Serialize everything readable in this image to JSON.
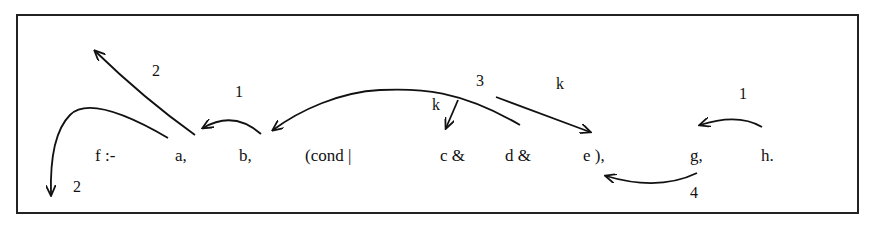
{
  "diagram": {
    "terms": [
      {
        "id": "f",
        "text": "f :-",
        "x": 95,
        "y": 146
      },
      {
        "id": "a",
        "text": "a,",
        "x": 175,
        "y": 146
      },
      {
        "id": "b",
        "text": "b,",
        "x": 239,
        "y": 146
      },
      {
        "id": "cond",
        "text": "(cond |",
        "x": 305,
        "y": 146
      },
      {
        "id": "c",
        "text": "c &",
        "x": 440,
        "y": 146
      },
      {
        "id": "d",
        "text": "d &",
        "x": 505,
        "y": 146
      },
      {
        "id": "e",
        "text": "e ),",
        "x": 583,
        "y": 146
      },
      {
        "id": "g",
        "text": "g,",
        "x": 690,
        "y": 146
      },
      {
        "id": "h",
        "text": "h.",
        "x": 761,
        "y": 146
      }
    ],
    "labels": [
      {
        "id": "l2-top",
        "text": "2",
        "x": 152,
        "y": 70
      },
      {
        "id": "l1-ab",
        "text": "1",
        "x": 235,
        "y": 91
      },
      {
        "id": "l2-bottom",
        "text": "2",
        "x": 73,
        "y": 186
      },
      {
        "id": "l3",
        "text": "3",
        "x": 476,
        "y": 80
      },
      {
        "id": "lk-c",
        "text": "k",
        "x": 432,
        "y": 104
      },
      {
        "id": "lk-e",
        "text": "k",
        "x": 556,
        "y": 83
      },
      {
        "id": "l1-hg",
        "text": "1",
        "x": 739,
        "y": 93
      },
      {
        "id": "l4",
        "text": "4",
        "x": 690,
        "y": 192
      }
    ],
    "arrows": [
      {
        "id": "a-to-top",
        "from": "a",
        "label": "2"
      },
      {
        "id": "a-to-bottom",
        "from": "a",
        "label": "2"
      },
      {
        "id": "b-to-a",
        "from": "b",
        "to": "a",
        "label": "1"
      },
      {
        "id": "d-to-b",
        "from": "d",
        "to": "b",
        "label": "3"
      },
      {
        "id": "to-c",
        "to": "c",
        "label": "k"
      },
      {
        "id": "to-e",
        "to": "e",
        "label": "k"
      },
      {
        "id": "h-to-g",
        "from": "h",
        "to": "g",
        "label": "1"
      },
      {
        "id": "g-to-e",
        "from": "g",
        "to": "e",
        "label": "4"
      }
    ]
  }
}
